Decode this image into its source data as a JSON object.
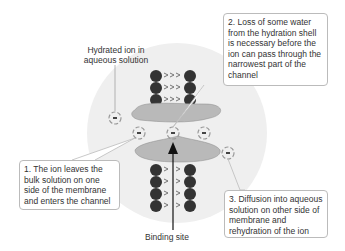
{
  "diagram": {
    "title_label": "Hydrated ion in aqueous solution",
    "title_line1": "Hydrated ion in",
    "title_line2": "aqueous solution",
    "binding_site_label": "Binding site",
    "callouts": [
      {
        "id": 1,
        "text": "1. The ion leaves the bulk solution on one side of the membrane and enters the channel"
      },
      {
        "id": 2,
        "text": "2. Loss of some water from the hydration shell is necessary before the ion can pass through the narrowest part of the channel"
      },
      {
        "id": 3,
        "text": "3. Diffusion into aqueous solution on other side of membrane and rehydration of the ion"
      }
    ],
    "colors": {
      "background_circle": "#efefef",
      "protein": "#b9b9b9",
      "lipid_head": "#333333",
      "ion_ring": "#999999",
      "text": "#333333",
      "callout_border": "#bbbbbb"
    }
  }
}
